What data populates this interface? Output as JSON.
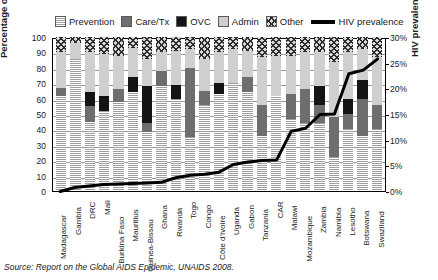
{
  "legend": {
    "items": [
      {
        "label": "Prevention",
        "icon": "prevention-swatch",
        "pattern": "horizontal-stripes",
        "color": "#b9b9b9"
      },
      {
        "label": "Care/Tx",
        "icon": "care-tx-swatch",
        "pattern": "solid",
        "color": "#6e6e6e"
      },
      {
        "label": "OVC",
        "icon": "ovc-swatch",
        "pattern": "solid",
        "color": "#141414"
      },
      {
        "label": "Admin",
        "icon": "admin-swatch",
        "pattern": "solid",
        "color": "#cfcfcf"
      },
      {
        "label": "Other",
        "icon": "other-swatch",
        "pattern": "crosshatch",
        "color": "#8f8f8f"
      },
      {
        "label": "HIV prevalence",
        "icon": "line-swatch",
        "pattern": "line",
        "color": "#000000"
      }
    ]
  },
  "source_note": "Source: Report on the Global AIDS Epidemic, UNAIDS 2008.",
  "chart_data": {
    "type": "bar",
    "title": "",
    "subtitle": "",
    "xlabel": "",
    "ylabel": "Percentage of national budget",
    "y2label": "HIV prevalence",
    "ylim": [
      0,
      100
    ],
    "y2lim": [
      0,
      30
    ],
    "yticks": [
      "0",
      "10",
      "20",
      "30",
      "40",
      "50",
      "60",
      "70",
      "80",
      "90",
      "100"
    ],
    "y2ticks": [
      "0%",
      "5%",
      "10%",
      "15%",
      "20%",
      "25%",
      "30%"
    ],
    "grid": true,
    "legend_position": "top",
    "stacked": true,
    "categories": [
      "Madagascar",
      "Gambia",
      "DRC",
      "Mali",
      "Burkina Faso",
      "Mauritius",
      "Guinea-Bissau",
      "Ghana",
      "Rwanda",
      "Togo",
      "Congo",
      "Côte d'Ivoire",
      "Uganda",
      "Gabon",
      "Tanzania",
      "CAR",
      "Malawi",
      "Mozambique",
      "Zambia",
      "Namibia",
      "Lesotho",
      "Botswana",
      "Swaziland"
    ],
    "series": [
      {
        "name": "Prevention",
        "values": [
          62,
          86,
          45,
          52,
          58,
          64,
          38,
          68,
          60,
          35,
          56,
          63,
          70,
          64,
          36,
          62,
          47,
          44,
          44,
          22,
          40,
          36,
          40
        ]
      },
      {
        "name": "Care/Tx",
        "values": [
          5,
          0,
          10,
          0,
          8,
          0,
          6,
          10,
          0,
          45,
          9,
          0,
          0,
          10,
          20,
          0,
          16,
          22,
          12,
          26,
          10,
          24,
          16
        ]
      },
      {
        "name": "OVC",
        "values": [
          0,
          0,
          9,
          10,
          0,
          10,
          24,
          0,
          9,
          0,
          0,
          7,
          0,
          0,
          0,
          0,
          0,
          0,
          12,
          0,
          10,
          12,
          0
        ]
      },
      {
        "name": "Admin",
        "values": [
          23,
          10,
          26,
          27,
          22,
          19,
          18,
          12,
          22,
          12,
          21,
          20,
          22,
          17,
          31,
          26,
          25,
          24,
          22,
          36,
          30,
          20,
          31
        ]
      },
      {
        "name": "Other",
        "values": [
          10,
          4,
          10,
          11,
          12,
          7,
          14,
          10,
          9,
          8,
          14,
          10,
          8,
          9,
          13,
          12,
          12,
          10,
          10,
          16,
          10,
          8,
          13
        ]
      }
    ],
    "line_series": {
      "name": "HIV prevalence",
      "unit": "%",
      "axis": "right",
      "values": [
        0.1,
        0.9,
        1.2,
        1.5,
        1.6,
        1.7,
        1.8,
        1.9,
        2.8,
        3.3,
        3.5,
        3.9,
        5.4,
        5.9,
        6.2,
        6.3,
        11.9,
        12.5,
        15.2,
        15.3,
        23.2,
        23.9,
        26.1
      ]
    }
  }
}
